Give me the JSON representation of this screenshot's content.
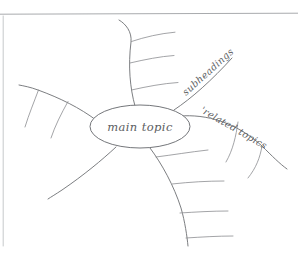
{
  "diagram": {
    "type": "hand-drawn-mind-map",
    "title_text": "main topic",
    "style": "pencil sketch on white paper",
    "ink_color": "#6d6f73",
    "background_color": "#ffffff",
    "rule_color": "#a8aaad",
    "center_node": {
      "label": "main topic",
      "shape": "ellipse"
    },
    "branch_labels": {
      "subheadings": "subheadings",
      "related_topics": "'related topics"
    },
    "branches": [
      {
        "name": "top-branch",
        "label": "",
        "sub_branch_count": 3,
        "direction": "up"
      },
      {
        "name": "subheadings-branch",
        "label": "subheadings",
        "sub_branch_count": 0,
        "direction": "upper-right"
      },
      {
        "name": "related-topics-branch",
        "label": "'related topics",
        "sub_branch_count": 2,
        "direction": "right"
      },
      {
        "name": "bottom-branch",
        "label": "",
        "sub_branch_count": 4,
        "direction": "down"
      },
      {
        "name": "lower-left-branch",
        "label": "",
        "sub_branch_count": 0,
        "direction": "lower-left"
      },
      {
        "name": "upper-left-branch",
        "label": "",
        "sub_branch_count": 2,
        "direction": "upper-left"
      }
    ]
  }
}
